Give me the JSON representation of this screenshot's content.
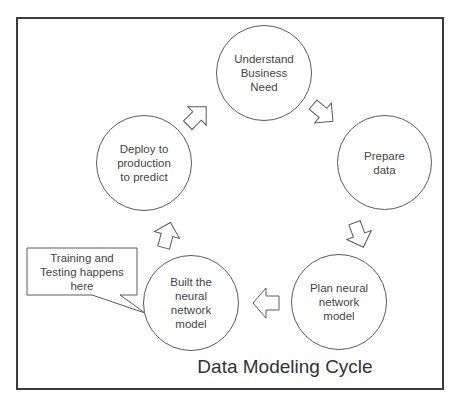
{
  "diagram": {
    "title": "Data Modeling Cycle",
    "nodes": [
      {
        "id": "understand",
        "label": "Understand\nBusiness\nNeed"
      },
      {
        "id": "prepare",
        "label": "Prepare\ndata"
      },
      {
        "id": "plan",
        "label": "Plan neural\nnetwork\nmodel"
      },
      {
        "id": "built",
        "label": "Built the\nneural\nnetwork\nmodel"
      },
      {
        "id": "deploy",
        "label": "Deploy to\nproduction\nto predict"
      }
    ],
    "edges": [
      {
        "from": "understand",
        "to": "prepare"
      },
      {
        "from": "prepare",
        "to": "plan"
      },
      {
        "from": "plan",
        "to": "built"
      },
      {
        "from": "built",
        "to": "deploy"
      },
      {
        "from": "deploy",
        "to": "understand"
      }
    ],
    "callout": {
      "target": "built",
      "text": "Training and\nTesting happens\nhere"
    }
  },
  "colors": {
    "stroke": "#5a5a5a",
    "frame": "#3c3c3c",
    "background": "#ffffff",
    "text": "#444444"
  }
}
